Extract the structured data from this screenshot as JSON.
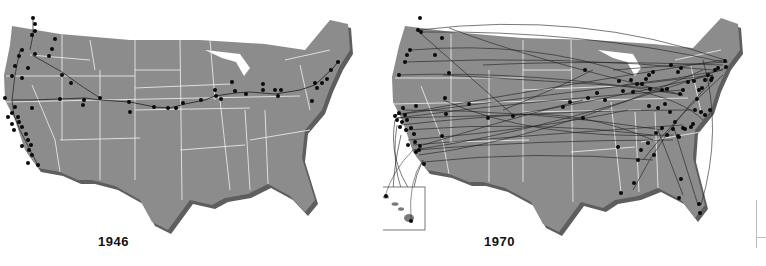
{
  "figure": {
    "panels": [
      {
        "id": "panel-1946",
        "caption": "1946",
        "map": "contiguous-united-states",
        "route_style": "single transcontinental chain with west-coast spurs",
        "airport_count_approx": 60
      },
      {
        "id": "panel-1970",
        "caption": "1970",
        "map": "contiguous-united-states",
        "route_style": "dense hub-and-spoke network of long-distance arcs",
        "airport_count_approx": 110,
        "inset": {
          "label": "hawaii-inset",
          "shown": true
        }
      }
    ],
    "colors": {
      "land": "#8c8c8c",
      "land_shadow": "#5e5e5e",
      "state_border": "#f2f2f2",
      "airport_dot": "#0a0a0a",
      "route_line": "#1e1e1e",
      "background": "#ffffff"
    }
  }
}
